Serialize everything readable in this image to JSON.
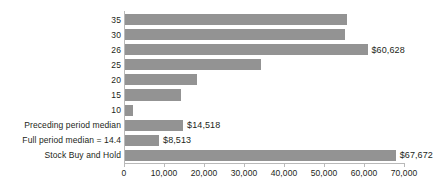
{
  "chart_data": {
    "type": "bar",
    "orientation": "horizontal",
    "title": "",
    "subtitle": "",
    "xlabel": "",
    "ylabel": "",
    "xlim": [
      0,
      70000
    ],
    "grid": false,
    "legend": false,
    "bar_color": "#939393",
    "axis_color": "#b9b9b9",
    "text_color": "#231f20",
    "xticks": [
      0,
      10000,
      20000,
      30000,
      40000,
      50000,
      60000,
      70000
    ],
    "xtick_labels": [
      "0",
      "10,000",
      "20,000",
      "30,000",
      "40,000",
      "50,000",
      "60,000",
      "70,000"
    ],
    "categories": [
      "35",
      "30",
      "26",
      "25",
      "20",
      "15",
      "10",
      "Preceding period median",
      "Full period median = 14.4",
      "Stock Buy and Hold"
    ],
    "values": [
      55500,
      55000,
      60628,
      34000,
      18000,
      14000,
      2000,
      14518,
      8513,
      67672
    ],
    "data_labels": [
      "",
      "",
      "$60,628",
      "",
      "",
      "",
      "",
      "$14,518",
      "$8,513",
      "$67,672"
    ],
    "bars": [
      {
        "category": "35",
        "value": 55500,
        "label": ""
      },
      {
        "category": "30",
        "value": 55000,
        "label": ""
      },
      {
        "category": "26",
        "value": 60628,
        "label": "$60,628"
      },
      {
        "category": "25",
        "value": 34000,
        "label": ""
      },
      {
        "category": "20",
        "value": 18000,
        "label": ""
      },
      {
        "category": "15",
        "value": 14000,
        "label": ""
      },
      {
        "category": "10",
        "value": 2000,
        "label": ""
      },
      {
        "category": "Preceding period median",
        "value": 14518,
        "label": "$14,518"
      },
      {
        "category": "Full period median = 14.4",
        "value": 8513,
        "label": "$8,513"
      },
      {
        "category": "Stock Buy and Hold",
        "value": 67672,
        "label": "$67,672"
      }
    ]
  }
}
